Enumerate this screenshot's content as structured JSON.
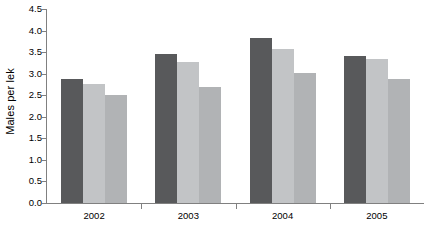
{
  "chart_data": {
    "type": "bar",
    "title": "",
    "subtitle": "",
    "xlabel": "",
    "ylabel": "Males per lek",
    "categories": [
      "2002",
      "2003",
      "2004",
      "2005"
    ],
    "ylim": [
      0.0,
      4.5
    ],
    "ytick_labels": [
      "0.0",
      "0.5",
      "1.0",
      "1.5",
      "2.0",
      "2.5",
      "3.0",
      "3.5",
      "4.0",
      "4.5"
    ],
    "ytick_values": [
      0.0,
      0.5,
      1.0,
      1.5,
      2.0,
      2.5,
      3.0,
      3.5,
      4.0,
      4.5
    ],
    "grid": false,
    "legend": "none",
    "series": [
      {
        "name": "Series 1",
        "color": "#58595b",
        "values": [
          2.88,
          3.45,
          3.82,
          3.4
        ]
      },
      {
        "name": "Series 2",
        "color": "#c2c4c6",
        "values": [
          2.77,
          3.27,
          3.57,
          3.35
        ]
      },
      {
        "name": "Series 3",
        "color": "#b1b3b5",
        "values": [
          2.5,
          2.7,
          3.01,
          2.87
        ]
      }
    ]
  },
  "axis": {
    "line_color": "#808080",
    "text_color": "#000000"
  }
}
